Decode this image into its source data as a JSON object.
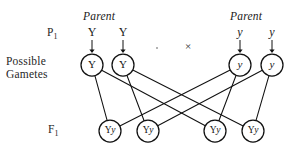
{
  "diagram": {
    "type": "monohybrid-cross-pedigree",
    "row_labels": {
      "p1": "P",
      "p1_subscript": "1",
      "gametes_line1": "Possible",
      "gametes_line2": "Gametes",
      "f1": "F",
      "f1_subscript": "1"
    },
    "parents": [
      {
        "id": "parent-left",
        "title": "Parent",
        "genotype": "YY"
      },
      {
        "id": "parent-right",
        "title": "Parent",
        "genotype": "yy"
      }
    ],
    "cross_symbol": "×",
    "top_alleles": [
      {
        "id": "top-allele-0",
        "label": "Y",
        "dominant": true,
        "x": 92,
        "y": 32
      },
      {
        "id": "top-allele-1",
        "label": "Y",
        "dominant": true,
        "x": 123,
        "y": 32
      },
      {
        "id": "top-allele-2",
        "label": "y",
        "dominant": false,
        "x": 240,
        "y": 32
      },
      {
        "id": "top-allele-3",
        "label": "y",
        "dominant": false,
        "x": 272,
        "y": 32
      }
    ],
    "gametes": [
      {
        "id": "gamete-0",
        "label": "Y",
        "dominant": true,
        "cx": 92,
        "cy": 65,
        "r": 11
      },
      {
        "id": "gamete-1",
        "label": "Y",
        "dominant": true,
        "cx": 123,
        "cy": 65,
        "r": 11
      },
      {
        "id": "gamete-2",
        "label": "y",
        "dominant": false,
        "cx": 240,
        "cy": 65,
        "r": 11
      },
      {
        "id": "gamete-3",
        "label": "y",
        "dominant": false,
        "cx": 272,
        "cy": 65,
        "r": 11
      }
    ],
    "offspring": [
      {
        "id": "offspring-0",
        "label": "Yy",
        "cx": 110,
        "cy": 131,
        "r": 11
      },
      {
        "id": "offspring-1",
        "label": "Yy",
        "cx": 148,
        "cy": 131,
        "r": 11
      },
      {
        "id": "offspring-2",
        "label": "Yy",
        "cx": 215,
        "cy": 131,
        "r": 11
      },
      {
        "id": "offspring-3",
        "label": "Yy",
        "cx": 253,
        "cy": 131,
        "r": 11
      }
    ],
    "fertilization_lines": [
      {
        "from": "gamete-0",
        "to": "offspring-0"
      },
      {
        "from": "gamete-0",
        "to": "offspring-2"
      },
      {
        "from": "gamete-1",
        "to": "offspring-1"
      },
      {
        "from": "gamete-1",
        "to": "offspring-3"
      },
      {
        "from": "gamete-2",
        "to": "offspring-0"
      },
      {
        "from": "gamete-2",
        "to": "offspring-2"
      },
      {
        "from": "gamete-3",
        "to": "offspring-1"
      },
      {
        "from": "gamete-3",
        "to": "offspring-3"
      }
    ],
    "arrows": [
      {
        "id": "arrow-0",
        "x": 92,
        "y_start": 40,
        "y_end": 53
      },
      {
        "id": "arrow-1",
        "x": 123,
        "y_start": 40,
        "y_end": 53
      },
      {
        "id": "arrow-2",
        "x": 240,
        "y_start": 40,
        "y_end": 53
      },
      {
        "id": "arrow-3",
        "x": 272,
        "y_start": 40,
        "y_end": 53
      }
    ],
    "colors": {
      "ink": "#1a1a1a",
      "stroke": "#111111",
      "background": "#ffffff"
    }
  }
}
